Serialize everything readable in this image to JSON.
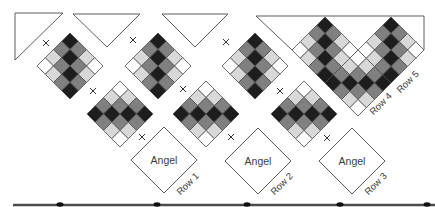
{
  "diagram": {
    "cell_half": 8.25,
    "cells_per_side": 4,
    "palette": [
      "#1d1d1d",
      "#808080",
      "#d8d8d8",
      "#ffffff"
    ],
    "stroke": "#4a4a4a",
    "rule": {
      "y": 205,
      "x1": 13,
      "x2": 435,
      "color": "#4a4a4a",
      "dots": [
        60,
        157,
        247,
        340,
        427
      ]
    }
  },
  "rows": [
    {
      "label": "Row 1",
      "label_pos": [
        190,
        186
      ],
      "setting_triangle": [
        [
          15,
          13
        ],
        [
          63,
          13
        ],
        [
          15,
          60
        ]
      ],
      "joins": [
        [
          46,
          43
        ],
        [
          93,
          91
        ],
        [
          142,
          137
        ]
      ],
      "blocks": [
        {
          "type": "pieced",
          "pattern": "vertical-stripe",
          "center": [
            70,
            66
          ]
        },
        {
          "type": "pieced",
          "pattern": "horizontal-stripe",
          "center": [
            120,
            114
          ]
        },
        {
          "type": "angel",
          "label": "Angel",
          "center": [
            164,
            160
          ]
        }
      ]
    },
    {
      "label": "Row 2",
      "label_pos": [
        284,
        186
      ],
      "setting_triangle": [
        [
          73,
          14
        ],
        [
          140,
          14
        ],
        [
          107,
          47
        ]
      ],
      "joins": [
        [
          133,
          40
        ],
        [
          183,
          89
        ],
        [
          231,
          137
        ]
      ],
      "blocks": [
        {
          "type": "pieced",
          "pattern": "vertical-stripe",
          "center": [
            158,
            66
          ]
        },
        {
          "type": "pieced",
          "pattern": "horizontal-stripe",
          "center": [
            206,
            114
          ]
        },
        {
          "type": "angel",
          "label": "Angel",
          "center": [
            258,
            161
          ]
        }
      ]
    },
    {
      "label": "Row 3",
      "label_pos": [
        378,
        186
      ],
      "setting_triangle": [
        [
          162,
          14
        ],
        [
          228,
          14
        ],
        [
          195,
          47
        ]
      ],
      "joins": [
        [
          226,
          42
        ],
        [
          280,
          91
        ],
        [
          327,
          138
        ]
      ],
      "blocks": [
        {
          "type": "pieced",
          "pattern": "vertical-stripe",
          "center": [
            255,
            66
          ]
        },
        {
          "type": "pieced",
          "pattern": "horizontal-stripe",
          "center": [
            304,
            114
          ]
        },
        {
          "type": "angel",
          "label": "Angel",
          "center": [
            352,
            161
          ]
        }
      ]
    }
  ],
  "corner": {
    "labels": [
      {
        "text": "Row 4",
        "pos": [
          383,
          106
        ]
      },
      {
        "text": "Row 5",
        "pos": [
          410,
          84
        ]
      }
    ],
    "outline": [
      [
        292,
        50
      ],
      [
        256,
        16
      ],
      [
        424,
        16
      ],
      [
        424,
        50
      ]
    ],
    "blocks": [
      {
        "type": "pieced",
        "pattern": "vertical-stripe",
        "center": [
          325,
          50
        ]
      },
      {
        "type": "pieced",
        "pattern": "horizontal-stripe",
        "center": [
          358,
          83
        ]
      },
      {
        "type": "pieced",
        "pattern": "vertical-stripe",
        "center": [
          391,
          50
        ]
      }
    ]
  }
}
